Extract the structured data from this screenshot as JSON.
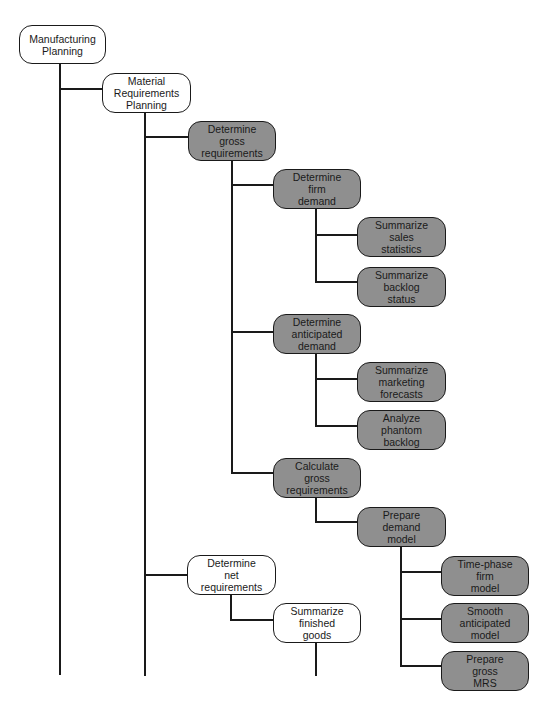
{
  "diagram": {
    "type": "hierarchy-tree",
    "colors": {
      "shaded_node": "#8f8f8f",
      "plain_node": "#ffffff",
      "line": "#1a1a1a"
    },
    "nodes": [
      {
        "id": "manufacturing-planning",
        "label": "Manufacturing\nPlanning",
        "shaded": false,
        "parent": null
      },
      {
        "id": "material-requirements-planning",
        "label": "Material\nRequirements\nPlanning",
        "shaded": false,
        "parent": "manufacturing-planning"
      },
      {
        "id": "determine-gross-requirements",
        "label": "Determine\ngross\nrequirements",
        "shaded": true,
        "parent": "material-requirements-planning"
      },
      {
        "id": "determine-firm-demand",
        "label": "Determine\nfirm\ndemand",
        "shaded": true,
        "parent": "determine-gross-requirements"
      },
      {
        "id": "summarize-sales-statistics",
        "label": "Summarize\nsales\nstatistics",
        "shaded": true,
        "parent": "determine-firm-demand"
      },
      {
        "id": "summarize-backlog-status",
        "label": "Summarize\nbacklog\nstatus",
        "shaded": true,
        "parent": "determine-firm-demand"
      },
      {
        "id": "determine-anticipated-demand",
        "label": "Determine\nanticipated\ndemand",
        "shaded": true,
        "parent": "determine-gross-requirements"
      },
      {
        "id": "summarize-marketing-forecasts",
        "label": "Summarize\nmarketing\nforecasts",
        "shaded": true,
        "parent": "determine-anticipated-demand"
      },
      {
        "id": "analyze-phantom-backlog",
        "label": "Analyze\nphantom\nbacklog",
        "shaded": true,
        "parent": "determine-anticipated-demand"
      },
      {
        "id": "calculate-gross-requirements",
        "label": "Calculate\ngross\nrequirements",
        "shaded": true,
        "parent": "determine-gross-requirements"
      },
      {
        "id": "prepare-demand-model",
        "label": "Prepare\ndemand\nmodel",
        "shaded": true,
        "parent": "calculate-gross-requirements"
      },
      {
        "id": "time-phase-firm-model",
        "label": "Time-phase\nfirm\nmodel",
        "shaded": true,
        "parent": "prepare-demand-model"
      },
      {
        "id": "smooth-anticipated-model",
        "label": "Smooth\nanticipated\nmodel",
        "shaded": true,
        "parent": "prepare-demand-model"
      },
      {
        "id": "prepare-gross-mrs",
        "label": "Prepare\ngross\nMRS",
        "shaded": true,
        "parent": "prepare-demand-model"
      },
      {
        "id": "determine-net-requirements",
        "label": "Determine\nnet\nrequirements",
        "shaded": false,
        "parent": "material-requirements-planning"
      },
      {
        "id": "summarize-finished-goods",
        "label": "Summarize\nfinished\ngoods",
        "shaded": false,
        "parent": "determine-net-requirements"
      }
    ]
  }
}
